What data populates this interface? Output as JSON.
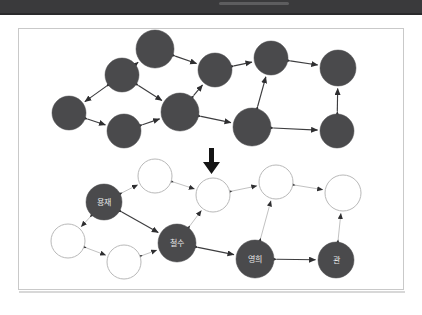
{
  "header": {
    "type": "dark-bar",
    "color": "#3a3a3c"
  },
  "page": {
    "frame_color": "#c9c9c9",
    "background": "#ffffff"
  },
  "style": {
    "node_fill_dark": "#4a4a4c",
    "node_fill_hollow": "#ffffff",
    "node_stroke_hollow": "#b9b9b9",
    "node_label_color": "#e8e8e8",
    "edge_color_dark": "#3d3d3f",
    "edge_color_light": "#c2c2c2",
    "transform_arrow_color": "#141414"
  },
  "transform_arrow": {
    "name": "down-arrow",
    "glyph": "down",
    "meaning": "transforms-into"
  },
  "graphs": [
    {
      "id": "graph-before",
      "caption": "",
      "all_nodes_filled": true,
      "nodes": [
        {
          "id": "u1",
          "label": "",
          "x": 122,
          "y": 75,
          "r": 17,
          "filled": true
        },
        {
          "id": "u2",
          "label": "",
          "x": 155,
          "y": 49,
          "r": 19,
          "filled": true
        },
        {
          "id": "u3",
          "label": "",
          "x": 215,
          "y": 70,
          "r": 17,
          "filled": true
        },
        {
          "id": "u4",
          "label": "",
          "x": 271,
          "y": 58,
          "r": 17,
          "filled": true
        },
        {
          "id": "u5",
          "label": "",
          "x": 338,
          "y": 68,
          "r": 18,
          "filled": true
        },
        {
          "id": "u6",
          "label": "",
          "x": 69,
          "y": 113,
          "r": 17,
          "filled": true
        },
        {
          "id": "u7",
          "label": "",
          "x": 124,
          "y": 131,
          "r": 17,
          "filled": true
        },
        {
          "id": "u8",
          "label": "",
          "x": 180,
          "y": 112,
          "r": 19,
          "filled": true
        },
        {
          "id": "u9",
          "label": "",
          "x": 252,
          "y": 127,
          "r": 19,
          "filled": true
        },
        {
          "id": "u10",
          "label": "",
          "x": 337,
          "y": 131,
          "r": 17,
          "filled": true
        }
      ],
      "node_labels_visible": [
        "용재",
        "관"
      ],
      "labeled_nodes": [
        {
          "id": "u1",
          "label": "용재"
        },
        {
          "id": "u10",
          "label": "관"
        }
      ],
      "edges": [
        {
          "from": "u1",
          "to": "u2",
          "bidirectional": true
        },
        {
          "from": "u2",
          "to": "u3",
          "bidirectional": true
        },
        {
          "from": "u3",
          "to": "u4",
          "bidirectional": true
        },
        {
          "from": "u4",
          "to": "u5",
          "bidirectional": true
        },
        {
          "from": "u1",
          "to": "u6",
          "bidirectional": true
        },
        {
          "from": "u1",
          "to": "u8",
          "bidirectional": true
        },
        {
          "from": "u6",
          "to": "u7",
          "bidirectional": true
        },
        {
          "from": "u7",
          "to": "u8",
          "bidirectional": true
        },
        {
          "from": "u8",
          "to": "u3",
          "bidirectional": true
        },
        {
          "from": "u8",
          "to": "u9",
          "bidirectional": true
        },
        {
          "from": "u9",
          "to": "u4",
          "bidirectional": true
        },
        {
          "from": "u9",
          "to": "u10",
          "bidirectional": true
        },
        {
          "from": "u10",
          "to": "u5",
          "bidirectional": true
        }
      ]
    },
    {
      "id": "graph-after",
      "caption": "",
      "all_nodes_filled": false,
      "nodes": [
        {
          "id": "l1",
          "label": "용재",
          "x": 104,
          "y": 202,
          "r": 18,
          "filled": true
        },
        {
          "id": "l2",
          "label": "",
          "x": 155,
          "y": 176,
          "r": 17,
          "filled": false
        },
        {
          "id": "l3",
          "label": "",
          "x": 213,
          "y": 195,
          "r": 17,
          "filled": false
        },
        {
          "id": "l4",
          "label": "",
          "x": 276,
          "y": 182,
          "r": 17,
          "filled": false
        },
        {
          "id": "l5",
          "label": "",
          "x": 343,
          "y": 193,
          "r": 18,
          "filled": false
        },
        {
          "id": "l6",
          "label": "",
          "x": 68,
          "y": 241,
          "r": 17,
          "filled": false
        },
        {
          "id": "l7",
          "label": "",
          "x": 124,
          "y": 262,
          "r": 17,
          "filled": false
        },
        {
          "id": "l8",
          "label": "철수",
          "x": 177,
          "y": 243,
          "r": 19,
          "filled": true
        },
        {
          "id": "l9",
          "label": "영희",
          "x": 255,
          "y": 259,
          "r": 19,
          "filled": true
        },
        {
          "id": "l10",
          "label": "관",
          "x": 336,
          "y": 260,
          "r": 18,
          "filled": true
        }
      ],
      "labeled_nodes": [
        {
          "id": "l1",
          "label": "용재"
        },
        {
          "id": "l8",
          "label": "철수"
        },
        {
          "id": "l9",
          "label": "영희"
        },
        {
          "id": "l10",
          "label": "관"
        }
      ],
      "hollow_node_count": 6,
      "filled_node_count": 4,
      "edges": [
        {
          "from": "l1",
          "to": "l2",
          "bidirectional": true,
          "strong": false
        },
        {
          "from": "l2",
          "to": "l3",
          "bidirectional": true,
          "strong": false
        },
        {
          "from": "l3",
          "to": "l4",
          "bidirectional": true,
          "strong": false
        },
        {
          "from": "l4",
          "to": "l5",
          "bidirectional": true,
          "strong": false
        },
        {
          "from": "l1",
          "to": "l6",
          "bidirectional": true,
          "strong": false
        },
        {
          "from": "l1",
          "to": "l8",
          "bidirectional": true,
          "strong": true
        },
        {
          "from": "l6",
          "to": "l7",
          "bidirectional": true,
          "strong": false
        },
        {
          "from": "l7",
          "to": "l8",
          "bidirectional": true,
          "strong": false
        },
        {
          "from": "l8",
          "to": "l3",
          "bidirectional": true,
          "strong": false
        },
        {
          "from": "l8",
          "to": "l9",
          "bidirectional": true,
          "strong": true
        },
        {
          "from": "l9",
          "to": "l4",
          "bidirectional": true,
          "strong": false
        },
        {
          "from": "l9",
          "to": "l10",
          "bidirectional": true,
          "strong": true
        },
        {
          "from": "l10",
          "to": "l5",
          "bidirectional": true,
          "strong": false
        }
      ]
    }
  ]
}
